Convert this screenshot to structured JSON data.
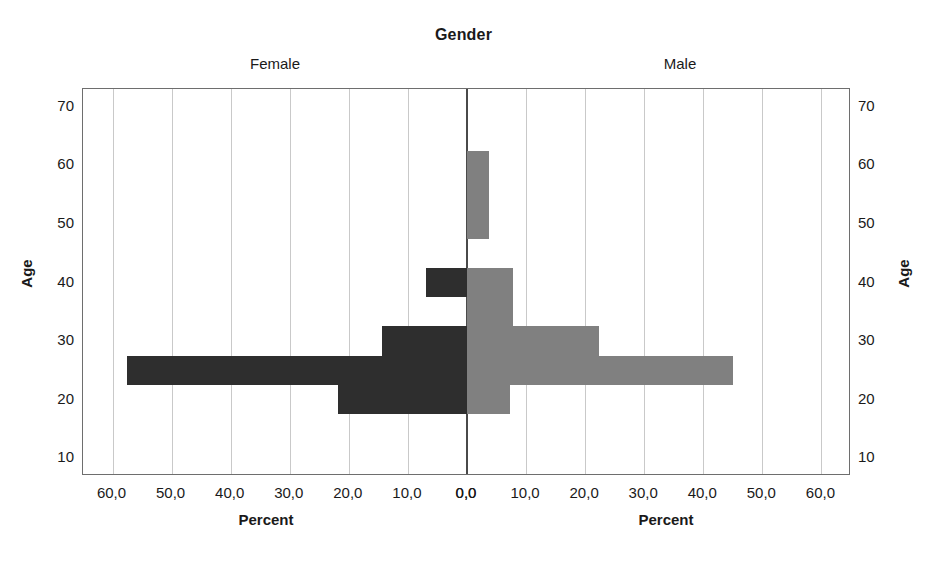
{
  "chart_data": {
    "type": "bar",
    "subtype": "population-pyramid",
    "title": "Gender",
    "panels": [
      {
        "key": "female",
        "label": "Female",
        "side": "left",
        "color": "#2e2e2e"
      },
      {
        "key": "male",
        "label": "Male",
        "side": "right",
        "color": "#808080"
      }
    ],
    "xlabel": "Percent",
    "ylabel": "Age",
    "categories": [
      20,
      25,
      30,
      35,
      40,
      45,
      50,
      55,
      60,
      65,
      70
    ],
    "series": [
      {
        "name": "Female",
        "values": [
          21.9,
          57.6,
          14.4,
          0.0,
          7.0,
          0.0,
          0.0,
          0.0,
          0.0,
          0.0,
          0.0
        ]
      },
      {
        "name": "Male",
        "values": [
          7.3,
          45.0,
          22.4,
          7.8,
          7.8,
          0.0,
          3.8,
          3.8,
          3.8,
          0.0,
          0.0
        ]
      }
    ],
    "bar_band_years": 5,
    "xticks_left": [
      "60,0",
      "50,0",
      "40,0",
      "30,0",
      "20,0",
      "10,0",
      "0,0"
    ],
    "xticks_right": [
      "0,0",
      "10,0",
      "20,0",
      "30,0",
      "40,0",
      "50,0",
      "60,0"
    ],
    "xtick_values_left": [
      60,
      50,
      40,
      30,
      20,
      10,
      0
    ],
    "xtick_values_right": [
      0,
      10,
      20,
      30,
      40,
      50,
      60
    ],
    "yticks": [
      "70",
      "60",
      "50",
      "40",
      "30",
      "20",
      "10"
    ],
    "ytick_values": [
      70,
      60,
      50,
      40,
      30,
      20,
      10
    ],
    "xlim": [
      0,
      65
    ],
    "ylim": [
      7,
      73
    ],
    "grid": true,
    "legend": "none",
    "background_color": "#ffffff",
    "gridline_color": "#c9c9c9",
    "axis_color": "#6e6e6e",
    "center_axis_color": "#4a4a4a"
  }
}
